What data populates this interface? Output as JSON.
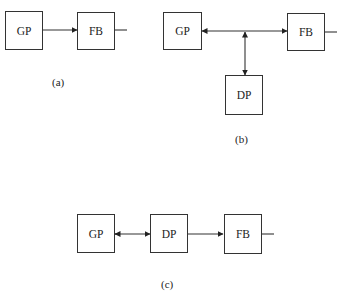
{
  "diagram": {
    "a": {
      "caption": "(a)",
      "nodes": [
        {
          "id": "GP",
          "label": "GP"
        },
        {
          "id": "FB",
          "label": "FB"
        }
      ],
      "edges": [
        {
          "from": "GP",
          "to": "FB",
          "direction": "forward"
        },
        {
          "from": "FB",
          "to": "output",
          "direction": "none"
        }
      ]
    },
    "b": {
      "caption": "(b)",
      "nodes": [
        {
          "id": "GP",
          "label": "GP"
        },
        {
          "id": "FB",
          "label": "FB"
        },
        {
          "id": "DP",
          "label": "DP"
        }
      ],
      "edges": [
        {
          "from": "junction",
          "to": "GP",
          "direction": "forward"
        },
        {
          "from": "junction",
          "to": "FB",
          "direction": "forward"
        },
        {
          "from": "junction",
          "to": "DP",
          "direction": "bidirectional"
        },
        {
          "from": "FB",
          "to": "output",
          "direction": "none"
        }
      ]
    },
    "c": {
      "caption": "(c)",
      "nodes": [
        {
          "id": "GP",
          "label": "GP"
        },
        {
          "id": "DP",
          "label": "DP"
        },
        {
          "id": "FB",
          "label": "FB"
        }
      ],
      "edges": [
        {
          "from": "GP",
          "to": "DP",
          "direction": "bidirectional"
        },
        {
          "from": "DP",
          "to": "FB",
          "direction": "forward"
        },
        {
          "from": "FB",
          "to": "output",
          "direction": "none"
        }
      ]
    }
  }
}
